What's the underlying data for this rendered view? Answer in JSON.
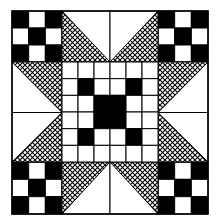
{
  "quilt": {
    "colors": {
      "ink": "#000000",
      "paper": "#ffffff"
    },
    "block": {
      "x": 12,
      "y": 11,
      "width": 196,
      "height": 203
    },
    "corner_ninepatch": [
      [
        1,
        0,
        1
      ],
      [
        0,
        1,
        0
      ],
      [
        1,
        0,
        1
      ]
    ],
    "center_grid": [
      [
        0,
        0,
        0,
        0,
        0,
        0
      ],
      [
        0,
        1,
        0,
        0,
        1,
        0
      ],
      [
        0,
        0,
        1,
        1,
        0,
        0
      ],
      [
        0,
        0,
        1,
        1,
        0,
        0
      ],
      [
        0,
        1,
        0,
        0,
        1,
        0
      ],
      [
        0,
        0,
        0,
        0,
        0,
        0
      ]
    ],
    "edge_units": "hatched half-square triangles forming star points"
  }
}
